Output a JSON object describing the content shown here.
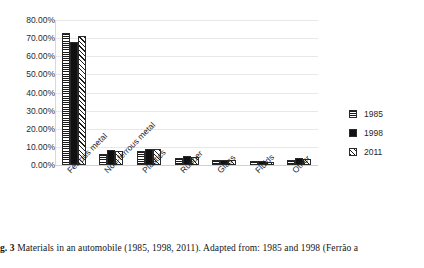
{
  "chart_data": {
    "type": "bar",
    "title": "",
    "xlabel": "",
    "ylabel": "",
    "ylim": [
      0,
      80
    ],
    "ytick_labels": [
      "80.00%",
      "70.00%",
      "60.00%",
      "50.00%",
      "40.00%",
      "30.00%",
      "20.00%",
      "10.00%",
      "0.00%"
    ],
    "ytick_values": [
      80,
      70,
      60,
      50,
      40,
      30,
      20,
      10,
      0
    ],
    "grid": true,
    "legend_position": "right",
    "categories": [
      "Ferrous metal",
      "Non-ferrous metal",
      "Plastics",
      "Rubber",
      "Glass",
      "Fluids",
      "Other"
    ],
    "series": [
      {
        "name": "1985",
        "pattern": "horizontal-lines",
        "values": [
          73.0,
          6.0,
          7.5,
          4.0,
          3.0,
          2.0,
          3.0
        ]
      },
      {
        "name": "1998",
        "pattern": "solid-black",
        "values": [
          68.0,
          8.5,
          9.0,
          5.0,
          3.0,
          2.0,
          4.0
        ]
      },
      {
        "name": "2011",
        "pattern": "diagonal-stripes",
        "values": [
          71.0,
          7.5,
          9.0,
          4.5,
          2.5,
          1.5,
          3.5
        ]
      }
    ]
  },
  "caption": {
    "label": "g. 3",
    "text": "Materials in an automobile (1985, 1998, 2011). Adapted from: 1985 and 1998 (Ferrão a"
  }
}
